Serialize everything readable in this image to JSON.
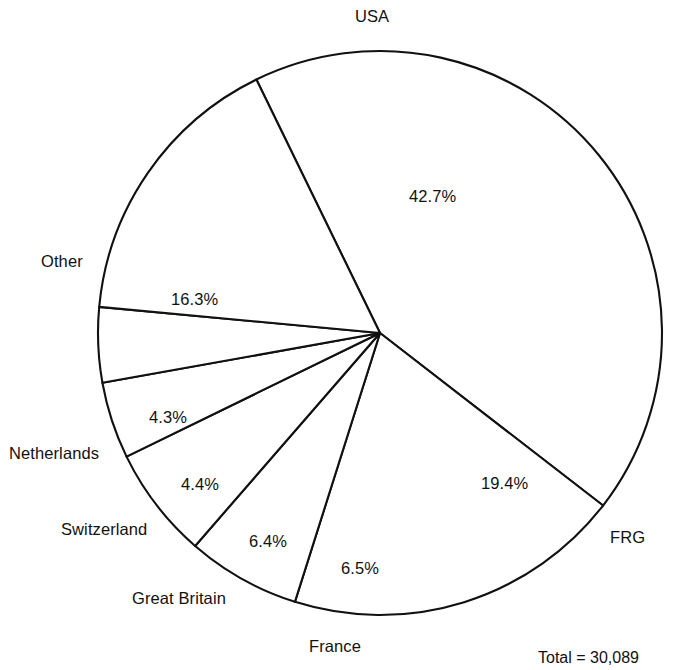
{
  "chart_data": {
    "type": "pie",
    "title": "",
    "subtitle": "",
    "xlabel": "",
    "ylabel": "",
    "legend_position": "none",
    "grid": false,
    "total_label": "Total = 30,089",
    "total_value": 30089,
    "categories": [
      "USA",
      "FRG",
      "France",
      "Great Britain",
      "Switzerland",
      "Netherlands",
      "Other"
    ],
    "values": [
      42.7,
      19.4,
      6.5,
      6.4,
      4.4,
      4.3,
      16.3
    ],
    "unit": "%",
    "slices": [
      {
        "label": "USA",
        "value": 42.7,
        "pct_text": "42.7%",
        "start_deg": -26.0,
        "sweep_deg": 153.72,
        "cat_x": 355,
        "cat_y": 8,
        "pct_x": 409,
        "pct_y": 188
      },
      {
        "label": "FRG",
        "value": 19.4,
        "pct_text": "19.4%",
        "start_deg": 127.72,
        "sweep_deg": 69.84,
        "cat_x": 610,
        "cat_y": 529,
        "pct_x": 481,
        "pct_y": 475
      },
      {
        "label": "France",
        "value": 6.5,
        "pct_text": "6.5%",
        "start_deg": 197.56,
        "sweep_deg": 23.4,
        "cat_x": 309,
        "cat_y": 638,
        "pct_x": 341,
        "pct_y": 560
      },
      {
        "label": "Great Britain",
        "value": 6.4,
        "pct_text": "6.4%",
        "start_deg": 220.96,
        "sweep_deg": 23.04,
        "cat_x": 132,
        "cat_y": 590,
        "pct_x": 249,
        "pct_y": 533
      },
      {
        "label": "Switzerland",
        "value": 4.4,
        "pct_text": "4.4%",
        "start_deg": 244.0,
        "sweep_deg": 15.84,
        "cat_x": 61,
        "cat_y": 521,
        "pct_x": 181,
        "pct_y": 476
      },
      {
        "label": "Netherlands",
        "value": 4.3,
        "pct_text": "4.3%",
        "start_deg": 259.84,
        "sweep_deg": 15.48,
        "cat_x": 9,
        "cat_y": 445,
        "pct_x": 149,
        "pct_y": 409
      },
      {
        "label": "Other",
        "value": 16.3,
        "pct_text": "16.3%",
        "start_deg": 275.32,
        "sweep_deg": 58.68,
        "cat_x": 41,
        "cat_y": 253,
        "pct_x": 171,
        "pct_y": 291
      }
    ],
    "geometry": {
      "cx": 380,
      "cy": 333,
      "r": 282
    }
  },
  "colors": {
    "background": "#ffffff",
    "stroke": "#111111",
    "slice_fill": "#ffffff",
    "text": "#111111"
  }
}
